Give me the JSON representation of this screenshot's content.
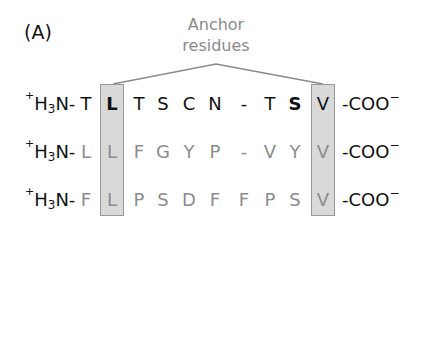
{
  "panel_label": "(A)",
  "annotation": {
    "line1": "Anchor",
    "line2": "residues",
    "color": "#8a8a8a"
  },
  "colors": {
    "anchor_box_fill": "#d9d9d9",
    "anchor_box_border": "#9a9a9a",
    "dark_text": "#111111",
    "gray_text": "#8c8c8c"
  },
  "terminus": {
    "n_prefix_charge": "+",
    "n_prefix_main": "H",
    "n_prefix_sub": "3",
    "n_prefix_tail": "N-",
    "c_suffix_main": "-COO",
    "c_suffix_charge": "−"
  },
  "anchor_positions": [
    2,
    9
  ],
  "sequences": [
    {
      "residues": [
        "T",
        "L",
        "T",
        "S",
        "C",
        "N",
        "-",
        "T",
        "S",
        "V"
      ],
      "tone": "dark"
    },
    {
      "residues": [
        "L",
        "L",
        "F",
        "G",
        "Y",
        "P",
        "-",
        "V",
        "Y",
        "V"
      ],
      "tone": "gray"
    },
    {
      "residues": [
        "F",
        "L",
        "P",
        "S",
        "D",
        "F",
        "F",
        "P",
        "S",
        "V"
      ],
      "tone": "gray"
    }
  ]
}
